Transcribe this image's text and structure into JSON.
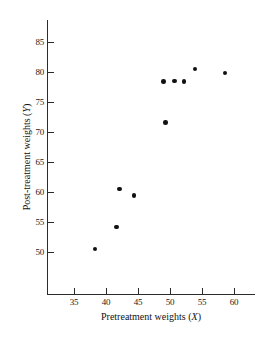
{
  "chart_data": {
    "type": "scatter",
    "title": "",
    "xlabel": "Pretreatment weights (X)",
    "ylabel": "Post-treatment weights (Y)",
    "xlabel_text": "Pretreatment weights",
    "xlabel_var": "X",
    "ylabel_text": "Post-treatment weights",
    "ylabel_var": "Y",
    "xlim": [
      32.5,
      64
    ],
    "ylim": [
      46.5,
      88
    ],
    "xticks": [
      35,
      40,
      45,
      50,
      55,
      60
    ],
    "xtick_labels": [
      "35",
      "40",
      "45",
      "50",
      "55",
      "60"
    ],
    "yticks": [
      50,
      55,
      60,
      65,
      70,
      75,
      80,
      85
    ],
    "ytick_labels": [
      "50",
      "55",
      "60",
      "65",
      "70",
      "75",
      "80",
      "85"
    ],
    "grid": false,
    "legend": null,
    "marker": "filled-circle",
    "marker_color": "#111111",
    "axis_color": "#2b2b2b",
    "background_color": "#ffffff",
    "x": [
      38.3,
      41.6,
      42.1,
      44.4,
      49.3,
      49.0,
      50.7,
      52.2,
      53.9,
      58.6
    ],
    "y": [
      50.5,
      54.2,
      60.5,
      59.4,
      71.6,
      78.4,
      78.5,
      78.4,
      80.5,
      79.8
    ],
    "points": [
      {
        "x": 38.3,
        "y": 50.5
      },
      {
        "x": 41.6,
        "y": 54.2
      },
      {
        "x": 42.1,
        "y": 60.5
      },
      {
        "x": 44.4,
        "y": 59.4
      },
      {
        "x": 49.3,
        "y": 71.6
      },
      {
        "x": 49.0,
        "y": 78.4
      },
      {
        "x": 50.7,
        "y": 78.5
      },
      {
        "x": 52.2,
        "y": 78.4
      },
      {
        "x": 53.9,
        "y": 80.5
      },
      {
        "x": 58.6,
        "y": 79.8
      }
    ]
  }
}
